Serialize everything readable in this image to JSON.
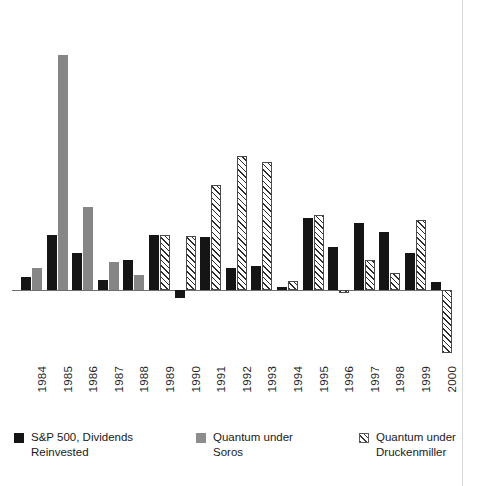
{
  "chart_data": {
    "type": "bar",
    "title": "",
    "subtitle": "",
    "xlabel": "",
    "ylabel": "",
    "grid": false,
    "legend_position": "bottom",
    "orientation": "vertical",
    "zero_line": true,
    "categories": [
      "1984",
      "1985",
      "1986",
      "1987",
      "1988",
      "1989",
      "1990",
      "1991",
      "1992",
      "1993",
      "1994",
      "1995",
      "1996",
      "1997",
      "1998",
      "1999",
      "2000"
    ],
    "series": [
      {
        "name": "S&P 500, Dividends Reinvested",
        "key": "sp500",
        "color": "#151515",
        "fill": "solid",
        "values": [
          6.3,
          31.7,
          18.7,
          5.3,
          16.6,
          31.7,
          -5.1,
          30.5,
          7.6,
          10.1,
          1.3,
          37.6,
          23.0,
          33.4,
          28.6,
          21.0,
          -9.1
        ]
      },
      {
        "name": "Quantum under Soros",
        "key": "soros",
        "color": "#868686",
        "fill": "solid",
        "values": [
          10.0,
          122.0,
          42.1,
          14.5,
          6.9,
          null,
          null,
          null,
          null,
          null,
          null,
          null,
          null,
          null,
          null,
          null,
          null
        ]
      },
      {
        "name": "Quantum under Druckenmiller",
        "key": "druck",
        "color": "#2b2b2b",
        "fill": "diagonal-hatch",
        "values": [
          null,
          null,
          null,
          null,
          null,
          31.6,
          29.6,
          53.4,
          68.6,
          63.2,
          4.0,
          39.0,
          -1.5,
          17.9,
          12.4,
          35.0,
          -32.0
        ]
      }
    ],
    "ylim": [
      -40,
      130
    ],
    "axis_units": "percent-annual-return"
  },
  "plot": {
    "baseline_y": 272,
    "px_per_unit": 1.93,
    "group_width": 25.6,
    "bar_width": 10,
    "bar_gap": 1,
    "bars": [
      {
        "year": "1984",
        "sp500_h": 13,
        "soros_h": 22,
        "druck_h": null
      },
      {
        "year": "1985",
        "sp500_h": 55,
        "soros_h": 235,
        "druck_h": null
      },
      {
        "year": "1986",
        "sp500_h": 37,
        "soros_h": 83,
        "druck_h": null
      },
      {
        "year": "1987",
        "sp500_h": 10,
        "soros_h": 28,
        "druck_h": null
      },
      {
        "year": "1988",
        "sp500_h": 30,
        "soros_h": 15,
        "druck_h": null
      },
      {
        "year": "1989",
        "sp500_h": 55,
        "soros_h": null,
        "druck_h": 55
      },
      {
        "year": "1990",
        "sp500_h": -8,
        "soros_h": null,
        "druck_h": 54
      },
      {
        "year": "1991",
        "sp500_h": 53,
        "soros_h": null,
        "druck_h": 105
      },
      {
        "year": "1992",
        "sp500_h": 22,
        "soros_h": null,
        "druck_h": 134
      },
      {
        "year": "1993",
        "sp500_h": 24,
        "soros_h": null,
        "druck_h": 128
      },
      {
        "year": "1994",
        "sp500_h": 3,
        "soros_h": null,
        "druck_h": 9
      },
      {
        "year": "1995",
        "sp500_h": 72,
        "soros_h": null,
        "druck_h": 75
      },
      {
        "year": "1996",
        "sp500_h": 43,
        "soros_h": null,
        "druck_h": -3
      },
      {
        "year": "1997",
        "sp500_h": 67,
        "soros_h": null,
        "druck_h": 30
      },
      {
        "year": "1998",
        "sp500_h": 58,
        "soros_h": null,
        "druck_h": 17
      },
      {
        "year": "1999",
        "sp500_h": 37,
        "soros_h": null,
        "druck_h": 70
      },
      {
        "year": "2000",
        "sp500_h": 8,
        "soros_h": null,
        "druck_h": -63
      }
    ]
  },
  "axis": {
    "years": [
      "1984",
      "1985",
      "1986",
      "1987",
      "1988",
      "1989",
      "1990",
      "1991",
      "1992",
      "1993",
      "1994",
      "1995",
      "1996",
      "1997",
      "1998",
      "1999",
      "2000"
    ]
  },
  "legend": {
    "items": [
      {
        "swatch": "sp500",
        "label": "S&P 500, Dividends\nReinvested"
      },
      {
        "swatch": "soros",
        "label": "Quantum under\nSoros"
      },
      {
        "swatch": "druck",
        "label": "Quantum under\nDruckenmiller"
      }
    ]
  },
  "colors": {
    "sp500": "#151515",
    "soros": "#868686",
    "druckenmiller_hatch": "#2b2b2b",
    "axis": "#6e6e6e",
    "background": "#ffffff",
    "text": "#1a1a1a"
  }
}
